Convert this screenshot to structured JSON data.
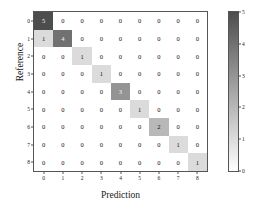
{
  "chart_data": {
    "type": "heatmap",
    "title": "",
    "xlabel": "Prediction",
    "ylabel": "Reference",
    "categories_x": [
      "0",
      "1",
      "2",
      "3",
      "4",
      "5",
      "6",
      "7",
      "8"
    ],
    "categories_y": [
      "0",
      "1",
      "2",
      "3",
      "4",
      "5",
      "6",
      "7",
      "8"
    ],
    "grid": false,
    "legend_position": "right",
    "colorbar": {
      "min": 0,
      "max": 5,
      "ticks": [
        "0",
        "1",
        "2",
        "3",
        "4",
        "5"
      ],
      "low_color": "#ffffff",
      "high_color": "#4d4d4d"
    },
    "matrix": [
      [
        5,
        0,
        0,
        0,
        0,
        0,
        0,
        0,
        0
      ],
      [
        1,
        4,
        0,
        0,
        0,
        0,
        0,
        0,
        0
      ],
      [
        0,
        0,
        1,
        0,
        0,
        0,
        0,
        0,
        0
      ],
      [
        0,
        0,
        0,
        1,
        0,
        0,
        0,
        0,
        0
      ],
      [
        0,
        0,
        0,
        0,
        3,
        0,
        0,
        0,
        0
      ],
      [
        0,
        0,
        0,
        0,
        0,
        1,
        0,
        0,
        0
      ],
      [
        0,
        0,
        0,
        0,
        0,
        0,
        2,
        0,
        0
      ],
      [
        0,
        0,
        0,
        0,
        0,
        0,
        0,
        1,
        0
      ],
      [
        0,
        0,
        0,
        0,
        0,
        0,
        0,
        0,
        1
      ]
    ]
  }
}
